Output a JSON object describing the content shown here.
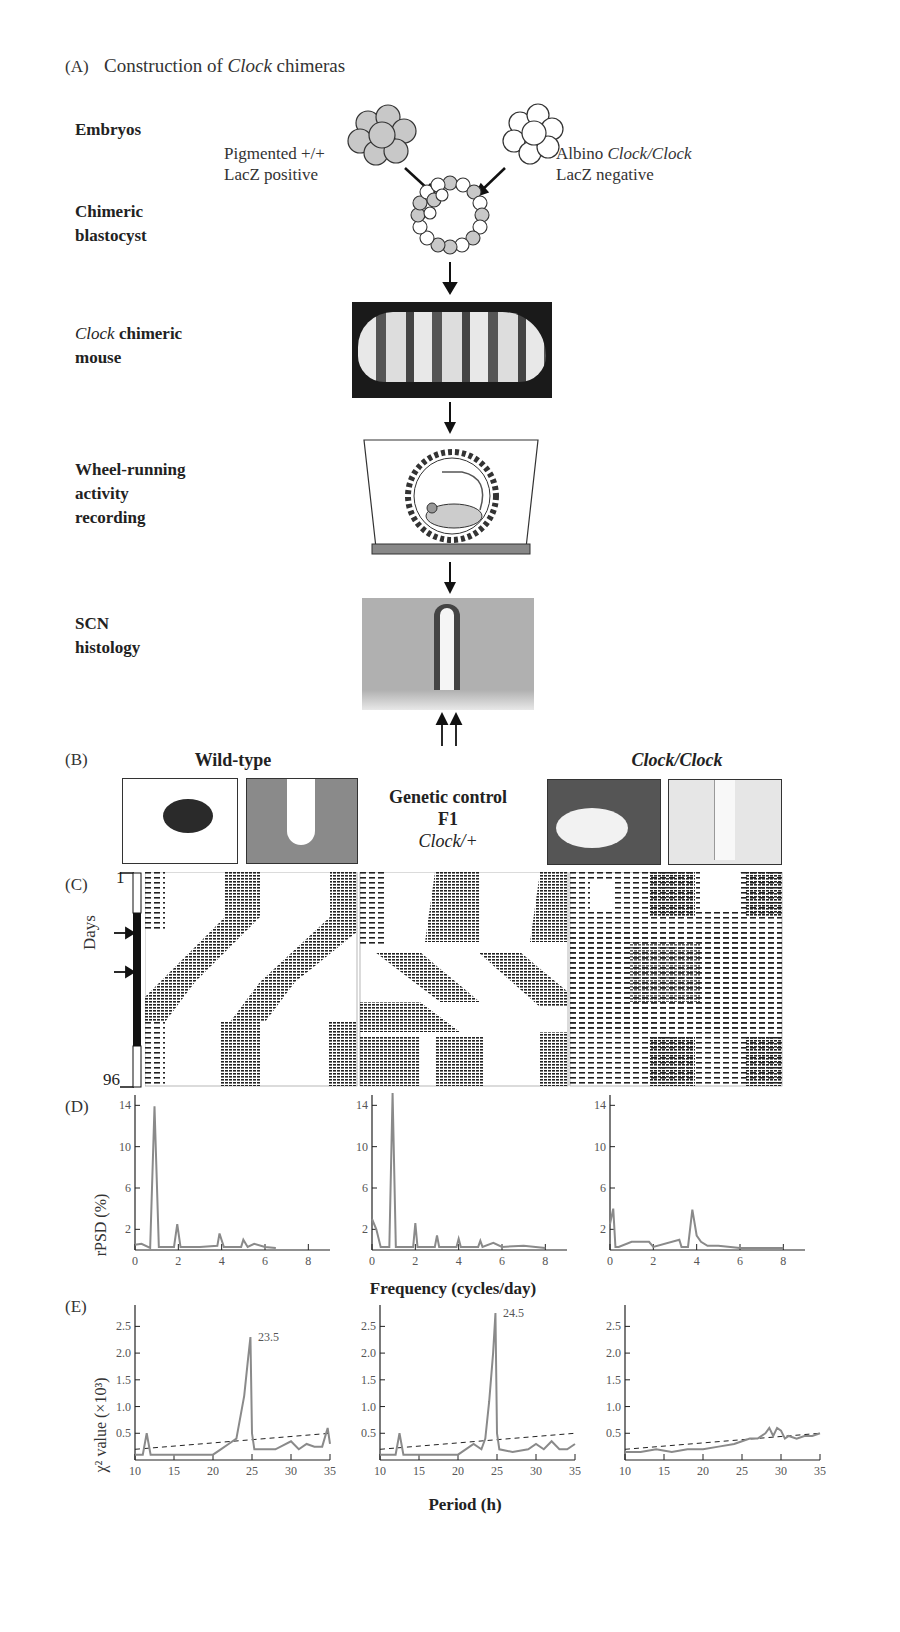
{
  "panel_a": {
    "letter": "(A)",
    "title_pre": "Construction of ",
    "title_italic": "Clock",
    "title_post": " chimeras",
    "steps": [
      {
        "label": "Embryos"
      },
      {
        "label_line1": "Chimeric",
        "label_line2": "blastocyst"
      },
      {
        "label_italic": "Clock",
        "label_rest": " chimeric",
        "label_line2": "mouse"
      },
      {
        "label_line1": "Wheel-running",
        "label_line2": "activity",
        "label_line3": "recording"
      },
      {
        "label_line1": "SCN",
        "label_line2": "histology"
      }
    ],
    "left_embryo_line1": "Pigmented +/+",
    "left_embryo_line2": "LacZ positive",
    "right_embryo_prefix": "Albino ",
    "right_embryo_italic": "Clock/Clock",
    "right_embryo_line2": "LacZ negative"
  },
  "panel_b": {
    "letter": "(B)",
    "wildtype_label": "Wild-type",
    "control_line1": "Genetic control",
    "control_line2": "F1",
    "control_line3": "Clock/+",
    "mutant_label": "Clock/Clock"
  },
  "panel_c": {
    "letter": "(C)",
    "ylabel": "Days",
    "y_top": "1",
    "y_bottom": "96"
  },
  "panel_d": {
    "letter": "(D)",
    "ylabel": "rPSD (%)",
    "xlabel": "Frequency (cycles/day)"
  },
  "panel_e": {
    "letter": "(E)",
    "ylabel": "χ² value (×10³)",
    "xlabel": "Period (h)",
    "peak_labels": [
      "23.5",
      "24.5"
    ]
  },
  "chart_data": [
    {
      "type": "line",
      "panel": "D",
      "title": "Wild-type",
      "xlabel": "Frequency (cycles/day)",
      "ylabel": "rPSD (%)",
      "xlim": [
        0,
        9
      ],
      "ylim": [
        0,
        15
      ],
      "xticks": [
        0,
        2,
        4,
        6,
        8
      ],
      "yticks": [
        2,
        6,
        10,
        14
      ],
      "x": [
        0,
        0.3,
        0.7,
        0.9,
        1.1,
        1.8,
        1.95,
        2.1,
        3.0,
        3.8,
        3.9,
        4.1,
        4.9,
        5.0,
        5.2,
        5.5,
        6.0,
        6.5
      ],
      "y": [
        0.5,
        0.6,
        0.2,
        13.9,
        0.3,
        0.3,
        2.5,
        0.3,
        0.3,
        0.4,
        1.6,
        0.3,
        0.3,
        1.0,
        0.3,
        0.6,
        0.3,
        0.2
      ]
    },
    {
      "type": "line",
      "panel": "D",
      "title": "Genetic control F1 Clock/+",
      "xlabel": "Frequency (cycles/day)",
      "ylabel": "rPSD (%)",
      "xlim": [
        0,
        9
      ],
      "ylim": [
        0,
        15
      ],
      "xticks": [
        0,
        2,
        4,
        6,
        8
      ],
      "yticks": [
        2,
        6,
        10,
        14
      ],
      "x": [
        0,
        0.2,
        0.4,
        0.8,
        0.95,
        1.1,
        1.9,
        2.0,
        2.1,
        2.9,
        3.0,
        3.1,
        3.9,
        4.0,
        4.1,
        4.9,
        5.0,
        5.1,
        5.6,
        6.0,
        7.0,
        8.0
      ],
      "y": [
        3.0,
        2.0,
        0.3,
        0.3,
        15.2,
        0.3,
        0.3,
        2.6,
        0.3,
        0.3,
        1.4,
        0.3,
        0.3,
        1.1,
        0.3,
        0.3,
        0.9,
        0.3,
        0.7,
        0.3,
        0.4,
        0.2
      ]
    },
    {
      "type": "line",
      "panel": "D",
      "title": "Clock/Clock",
      "xlabel": "Frequency (cycles/day)",
      "ylabel": "rPSD (%)",
      "xlim": [
        0,
        9
      ],
      "ylim": [
        0,
        15
      ],
      "xticks": [
        0,
        2,
        4,
        6,
        8
      ],
      "yticks": [
        2,
        6,
        10,
        14
      ],
      "x": [
        0,
        0.15,
        0.25,
        0.4,
        1.0,
        1.8,
        2.0,
        3.2,
        3.3,
        3.6,
        3.8,
        4.0,
        4.2,
        4.5,
        5.0,
        6.0,
        7.0,
        8.0
      ],
      "y": [
        2.5,
        4.0,
        0.3,
        0.3,
        0.8,
        0.8,
        0.3,
        1.0,
        0.3,
        0.3,
        3.9,
        1.4,
        0.8,
        0.4,
        0.4,
        0.2,
        0.2,
        0.2
      ]
    },
    {
      "type": "line",
      "panel": "E",
      "title": "Wild-type",
      "xlabel": "Period (h)",
      "ylabel": "χ² value (×10³)",
      "xlim": [
        10,
        35
      ],
      "ylim": [
        0,
        2.9
      ],
      "xticks": [
        10,
        15,
        20,
        25,
        30,
        35
      ],
      "yticks": [
        0.5,
        1.0,
        1.5,
        2.0,
        2.5
      ],
      "annotation": {
        "text": "23.5",
        "x": 25,
        "y": 2.3
      },
      "x": [
        10,
        11,
        11.5,
        12,
        13,
        15,
        17,
        20,
        21,
        22,
        23,
        24,
        24.5,
        24.8,
        25,
        25.3,
        26,
        28,
        30,
        31,
        32,
        33,
        34,
        34.7,
        35
      ],
      "y": [
        0.1,
        0.1,
        0.5,
        0.1,
        0.1,
        0.1,
        0.1,
        0.1,
        0.2,
        0.3,
        0.4,
        1.2,
        1.9,
        2.3,
        0.5,
        0.2,
        0.2,
        0.2,
        0.35,
        0.2,
        0.3,
        0.25,
        0.25,
        0.6,
        0.3
      ],
      "significance_line": {
        "x": [
          10,
          35
        ],
        "y": [
          0.2,
          0.5
        ],
        "style": "dashed"
      }
    },
    {
      "type": "line",
      "panel": "E",
      "title": "Genetic control F1 Clock/+",
      "xlabel": "Period (h)",
      "ylabel": "χ² value (×10³)",
      "xlim": [
        10,
        35
      ],
      "ylim": [
        0,
        2.9
      ],
      "xticks": [
        10,
        15,
        20,
        25,
        30,
        35
      ],
      "yticks": [
        0.5,
        1.0,
        1.5,
        2.0,
        2.5
      ],
      "annotation": {
        "text": "24.5",
        "x": 25,
        "y": 2.75
      },
      "x": [
        10,
        11,
        12,
        12.5,
        13,
        15,
        18,
        20,
        22,
        23,
        23.5,
        24,
        24.5,
        24.8,
        25,
        25.3,
        27,
        29,
        30,
        31,
        32,
        33,
        34,
        35
      ],
      "y": [
        0.1,
        0.1,
        0.1,
        0.5,
        0.1,
        0.1,
        0.1,
        0.1,
        0.3,
        0.2,
        0.4,
        1.1,
        2.0,
        2.75,
        0.5,
        0.2,
        0.15,
        0.2,
        0.3,
        0.2,
        0.35,
        0.2,
        0.2,
        0.3
      ],
      "significance_line": {
        "x": [
          10,
          35
        ],
        "y": [
          0.2,
          0.5
        ],
        "style": "dashed"
      }
    },
    {
      "type": "line",
      "panel": "E",
      "title": "Clock/Clock",
      "xlabel": "Period (h)",
      "ylabel": "χ² value (×10³)",
      "xlim": [
        10,
        35
      ],
      "ylim": [
        0,
        2.9
      ],
      "xticks": [
        10,
        15,
        20,
        25,
        30,
        35
      ],
      "yticks": [
        0.5,
        1.0,
        1.5,
        2.0,
        2.5
      ],
      "x": [
        10,
        12,
        14,
        16,
        18,
        20,
        22,
        24,
        25,
        26,
        27,
        28,
        28.5,
        29,
        29.5,
        30,
        30.5,
        31,
        32,
        33,
        34,
        35
      ],
      "y": [
        0.15,
        0.15,
        0.2,
        0.15,
        0.2,
        0.2,
        0.25,
        0.3,
        0.35,
        0.4,
        0.4,
        0.5,
        0.6,
        0.45,
        0.6,
        0.55,
        0.4,
        0.45,
        0.4,
        0.45,
        0.45,
        0.5
      ],
      "significance_line": {
        "x": [
          10,
          35
        ],
        "y": [
          0.2,
          0.5
        ],
        "style": "dashed"
      }
    }
  ]
}
